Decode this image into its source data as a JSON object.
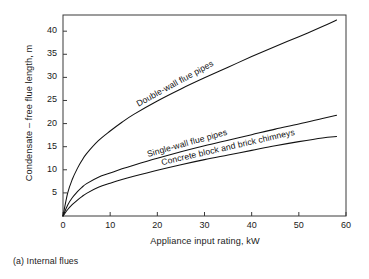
{
  "figure": {
    "caption": "(a) Internal flues",
    "axis_color": "#3a3a3a",
    "curve_color": "#111111",
    "background": "#ffffff"
  },
  "chart_data": {
    "type": "line",
    "title": "",
    "subtitle": "",
    "xlabel": "Appliance input rating, kW",
    "ylabel": "Condensate – free flue length, m",
    "xlim": [
      0,
      60
    ],
    "ylim": [
      0,
      43.5
    ],
    "xticks": [
      0,
      10,
      20,
      30,
      40,
      50,
      60
    ],
    "xticklabels": [
      "0",
      "10",
      "20",
      "30",
      "40",
      "50",
      "60"
    ],
    "yticks": [
      5,
      10,
      15,
      20,
      25,
      30,
      35,
      40
    ],
    "yticklabels": [
      "5",
      "10",
      "15",
      "20",
      "25",
      "30",
      "35",
      "40"
    ],
    "grid": false,
    "legend": "inline-labels-along-curves",
    "series": [
      {
        "name": "Double-wall flue pipes",
        "label_text": "Double-wall flue pipes",
        "x": [
          0,
          1,
          2,
          3,
          4,
          5,
          7.5,
          10,
          12.5,
          15,
          20,
          25,
          30,
          35,
          40,
          45,
          50,
          55,
          58
        ],
        "values": [
          0,
          5.0,
          8.0,
          10.2,
          12.0,
          13.5,
          16.3,
          18.4,
          20.3,
          22.0,
          24.9,
          27.5,
          29.9,
          32.2,
          34.5,
          36.7,
          38.8,
          41.0,
          42.4
        ]
      },
      {
        "name": "Single-wall flue pipes",
        "label_text": "Single-wall flue pipes",
        "x": [
          0,
          1,
          2,
          3,
          4,
          5,
          7.5,
          10,
          12.5,
          15,
          20,
          25,
          30,
          35,
          40,
          45,
          50,
          55,
          58
        ],
        "values": [
          0,
          2.4,
          4.0,
          5.2,
          6.2,
          7.0,
          8.4,
          9.3,
          10.2,
          11.0,
          12.5,
          13.9,
          15.2,
          16.4,
          17.6,
          18.8,
          19.9,
          21.1,
          21.8
        ]
      },
      {
        "name": "Concrete block and brick chimneys",
        "label_text": "Concrete block and brick chimneys",
        "x": [
          0,
          1,
          2,
          3,
          4,
          5,
          7.5,
          10,
          12.5,
          15,
          20,
          25,
          30,
          35,
          40,
          45,
          50,
          55,
          58
        ],
        "values": [
          0,
          1.4,
          2.5,
          3.4,
          4.2,
          4.9,
          6.2,
          7.1,
          7.9,
          8.6,
          9.9,
          11.1,
          12.2,
          13.2,
          14.2,
          15.2,
          16.1,
          16.9,
          17.2
        ]
      }
    ]
  }
}
